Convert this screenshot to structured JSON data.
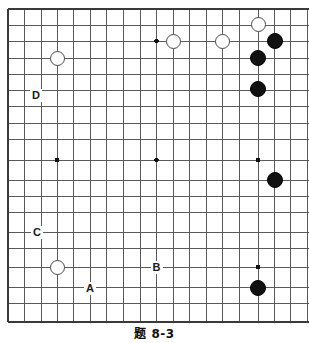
{
  "figure": {
    "caption": "题 8-3",
    "kind": "go-board-diagram",
    "board": {
      "line_color": "#5a5a5a",
      "border_color": "#3a3a3a",
      "background_color": "#ffffff",
      "star_point_color": "#111111",
      "columns": 19,
      "rows": 19,
      "spacing_px": 16.3,
      "origin_x_px": 8,
      "origin_y_px": 9,
      "visible_right_edge_px": 309,
      "bottom_edge_px": 322,
      "x_positions": [
        8,
        24.5,
        41,
        57,
        73.5,
        90,
        106.5,
        123,
        140,
        156.5,
        173,
        189.5,
        206,
        222.5,
        239,
        258,
        274,
        290.5,
        307
      ],
      "y_positions": [
        9,
        25,
        41.5,
        58,
        74,
        90.5,
        106.5,
        123,
        139.5,
        160,
        180,
        196,
        212.5,
        232,
        248.5,
        267,
        287,
        303.5,
        322
      ]
    },
    "stones": [
      {
        "name": "white-stone-top-left",
        "color": "#ffffff",
        "type": "white",
        "cx": 57,
        "cy": 58,
        "r": 7.5
      },
      {
        "name": "white-stone-top-center",
        "color": "#ffffff",
        "type": "white",
        "cx": 173,
        "cy": 41,
        "r": 7.5
      },
      {
        "name": "white-stone-top-right-inner",
        "color": "#ffffff",
        "type": "white",
        "cx": 222,
        "cy": 41,
        "r": 7.5
      },
      {
        "name": "white-stone-top-right-upper",
        "color": "#ffffff",
        "type": "white",
        "cx": 258,
        "cy": 24,
        "r": 7.5
      },
      {
        "name": "white-stone-bottom-left",
        "color": "#ffffff",
        "type": "white",
        "cx": 57,
        "cy": 267,
        "r": 7.5
      },
      {
        "name": "black-stone-top-right-corner",
        "color": "#111111",
        "type": "black",
        "cx": 275,
        "cy": 41,
        "r": 8
      },
      {
        "name": "black-stone-right-upper",
        "color": "#111111",
        "type": "black",
        "cx": 258,
        "cy": 58,
        "r": 8
      },
      {
        "name": "black-stone-right-third",
        "color": "#111111",
        "type": "black",
        "cx": 258,
        "cy": 89,
        "r": 8
      },
      {
        "name": "black-stone-right-middle",
        "color": "#111111",
        "type": "black",
        "cx": 275,
        "cy": 180,
        "r": 8
      },
      {
        "name": "black-stone-bottom-right",
        "color": "#111111",
        "type": "black",
        "cx": 258,
        "cy": 288,
        "r": 8
      }
    ],
    "star_points": [
      {
        "name": "star-point-top-center",
        "cx": 156.5,
        "cy": 41,
        "r": 2.2
      },
      {
        "name": "star-point-left-center",
        "cx": 57,
        "cy": 160,
        "r": 2.2
      },
      {
        "name": "star-point-center",
        "cx": 156.5,
        "cy": 160,
        "r": 2.2
      },
      {
        "name": "star-point-right-center",
        "cx": 258,
        "cy": 160,
        "r": 2.2
      },
      {
        "name": "star-point-bottom-right",
        "cx": 258,
        "cy": 267,
        "r": 2.2
      }
    ],
    "labels": [
      {
        "name": "board-label-d",
        "text": "D",
        "cx": 36,
        "cy": 95
      },
      {
        "name": "board-label-c",
        "text": "C",
        "cx": 37,
        "cy": 232
      },
      {
        "name": "board-label-b",
        "text": "B",
        "cx": 156.5,
        "cy": 267
      },
      {
        "name": "board-label-a",
        "text": "A",
        "cx": 90,
        "cy": 288
      }
    ]
  }
}
